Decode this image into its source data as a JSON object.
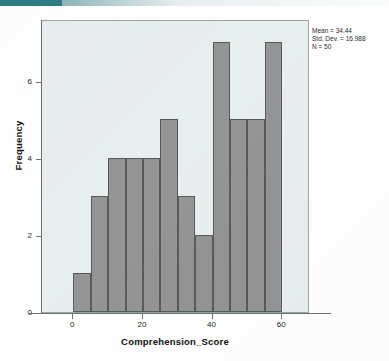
{
  "chart_data": {
    "type": "bar",
    "title": "",
    "subtitle": "",
    "xlabel": "Comprehension_Score",
    "ylabel": "Frequency",
    "xlim": [
      -9,
      68
    ],
    "ylim": [
      0,
      7.6
    ],
    "xticks": [
      0,
      20,
      40,
      60
    ],
    "xtick_labels": [
      "0",
      "20",
      "40",
      "60"
    ],
    "yticks": [
      0,
      2,
      4,
      6
    ],
    "ytick_labels": [
      "0",
      "2",
      "4",
      "6"
    ],
    "grid": false,
    "legend": "none",
    "bin_width": 5,
    "bin_starts": [
      0,
      5,
      10,
      15,
      20,
      25,
      30,
      35,
      40,
      45,
      50,
      55
    ],
    "bin_edges": [
      0,
      5,
      10,
      15,
      20,
      25,
      30,
      35,
      40,
      45,
      50,
      55,
      60
    ],
    "categories": [
      "0-5",
      "5-10",
      "10-15",
      "15-20",
      "20-25",
      "25-30",
      "30-35",
      "35-40",
      "40-45",
      "45-50",
      "50-55",
      "55-60"
    ],
    "values": [
      1,
      3,
      4,
      4,
      4,
      5,
      3,
      2,
      7,
      5,
      5,
      7
    ],
    "bar_fill_color": "#949494",
    "bar_edge_color": "#555b5d",
    "plot_background_color": "#e8edee",
    "axis_color": "#6b7275"
  },
  "annotations": {
    "stats": {
      "mean_label": "Mean = 34.44",
      "std_dev_label": "Std. Dev. = 16.988",
      "n_label": "N = 50"
    }
  },
  "axes": {
    "y_title": "Frequency",
    "x_title": "Comprehension_Score"
  }
}
